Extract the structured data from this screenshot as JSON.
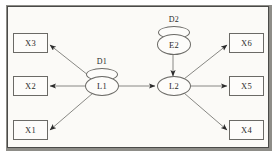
{
  "diagram": {
    "frame": {
      "background_color": "#fbfaf7",
      "border_color": "#4a4a48",
      "shadow_color": "#8e8d88"
    },
    "observed_variables": [
      {
        "id": "x3",
        "label": "X3",
        "column": "left",
        "row": "top"
      },
      {
        "id": "x2",
        "label": "X2",
        "column": "left",
        "row": "middle"
      },
      {
        "id": "x1",
        "label": "X1",
        "column": "left",
        "row": "bottom"
      },
      {
        "id": "x6",
        "label": "X6",
        "column": "right",
        "row": "top"
      },
      {
        "id": "x5",
        "label": "X5",
        "column": "right",
        "row": "middle"
      },
      {
        "id": "x4",
        "label": "X4",
        "column": "right",
        "row": "bottom"
      }
    ],
    "latent_variables": [
      {
        "id": "l1",
        "label": "L1"
      },
      {
        "id": "l2",
        "label": "L2"
      },
      {
        "id": "e2",
        "label": "E2"
      }
    ],
    "disturbances": [
      {
        "id": "d1",
        "label": "D1",
        "attached_to": "L1"
      },
      {
        "id": "d2",
        "label": "D2",
        "attached_to": "E2"
      }
    ],
    "edges": [
      {
        "from": "L1",
        "to": "X3",
        "arrow": "single"
      },
      {
        "from": "L1",
        "to": "X2",
        "arrow": "single"
      },
      {
        "from": "L1",
        "to": "X1",
        "arrow": "single"
      },
      {
        "from": "L1",
        "to": "L2",
        "arrow": "single"
      },
      {
        "from": "E2",
        "to": "L2",
        "arrow": "single"
      },
      {
        "from": "L2",
        "to": "X6",
        "arrow": "single"
      },
      {
        "from": "L2",
        "to": "X5",
        "arrow": "single"
      },
      {
        "from": "L2",
        "to": "X4",
        "arrow": "single"
      }
    ]
  }
}
